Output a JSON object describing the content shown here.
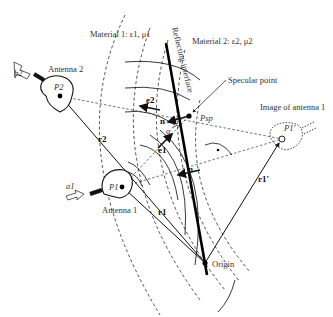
{
  "diagram": {
    "labels": {
      "material1": "Material 1: ε1, μ1",
      "material2": "Material 2: ε2, μ2",
      "interface": "Reflecting interface",
      "specular_point": "Specular point",
      "image_of_antenna1": "Image of antenna 1",
      "antenna1": "Antenna 1",
      "antenna2": "Antenna 2",
      "origin": "Origin",
      "p_sp": "Psp",
      "p1": "P1",
      "p2": "P2",
      "p1_image": "P1'",
      "a1": "a1",
      "b2": "b2",
      "r1": "r1",
      "r2": "r2",
      "r1_image": "r1'",
      "e1": "e1",
      "e2": "e2",
      "n_upper": "n",
      "n_lower": "n",
      "alpha": "α"
    },
    "colors": {
      "ink": "#111111",
      "text": "#333333",
      "background": "#ffffff"
    }
  }
}
